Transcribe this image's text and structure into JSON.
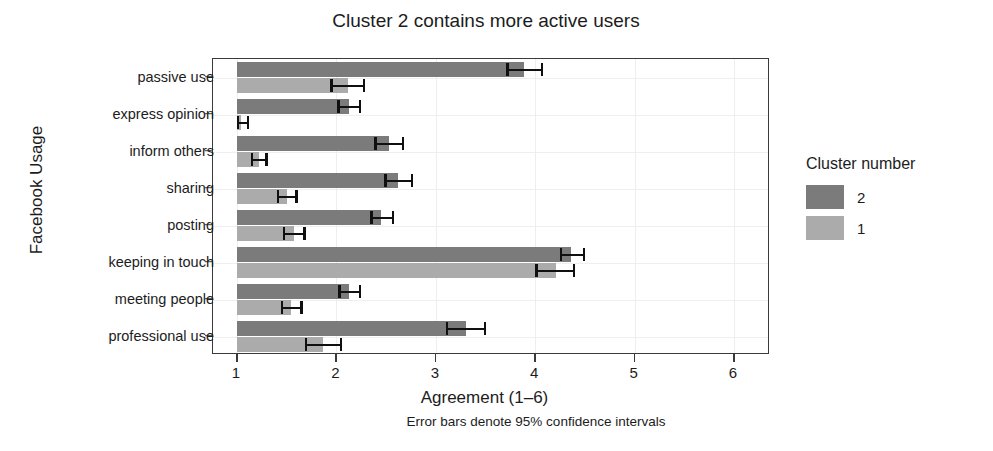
{
  "chart_data": {
    "type": "bar",
    "orientation": "horizontal",
    "title": "Cluster 2 contains more active users",
    "xlabel": "Agreement (1–6)",
    "ylabel": "Facebook Usage",
    "caption": "Error bars denote 95% confidence intervals",
    "xlim": [
      1,
      6.25
    ],
    "xticks": [
      1,
      2,
      3,
      4,
      5,
      6
    ],
    "xtick_labels": [
      "1",
      "2",
      "3",
      "4",
      "5",
      "6"
    ],
    "grid": true,
    "legend": {
      "title": "Cluster number",
      "position": "right",
      "entries": [
        {
          "label": "2",
          "color": "#7b7b7b"
        },
        {
          "label": "1",
          "color": "#ababab"
        }
      ]
    },
    "categories": [
      "passive use",
      "express opinion",
      "inform others",
      "sharing",
      "posting",
      "keeping in touch",
      "meeting people",
      "professional use"
    ],
    "series": [
      {
        "name": "2",
        "color": "#7b7b7b",
        "values": [
          3.89,
          2.13,
          2.53,
          2.62,
          2.45,
          4.36,
          2.13,
          3.3
        ],
        "ci_low": [
          3.71,
          2.01,
          2.38,
          2.48,
          2.34,
          4.25,
          2.02,
          3.1
        ],
        "ci_high": [
          4.08,
          2.25,
          2.68,
          2.77,
          2.58,
          4.5,
          2.25,
          3.51
        ]
      },
      {
        "name": "1",
        "color": "#ababab",
        "values": [
          2.12,
          1.04,
          1.22,
          1.5,
          1.57,
          4.21,
          1.54,
          1.87
        ],
        "ci_low": [
          1.94,
          0.98,
          1.14,
          1.4,
          1.46,
          4.0,
          1.44,
          1.68
        ],
        "ci_high": [
          2.29,
          1.12,
          1.31,
          1.61,
          1.69,
          4.4,
          1.66,
          2.06
        ]
      }
    ]
  }
}
